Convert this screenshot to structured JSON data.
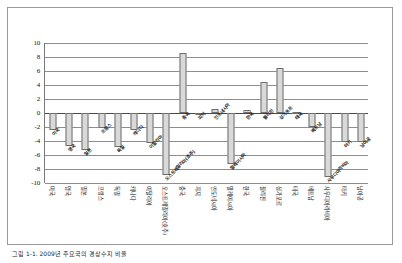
{
  "figure": {
    "caption": "그림 1-1. 2009년 주요국의 경상수지 비율"
  },
  "chart_data": {
    "type": "bar",
    "title": "",
    "subtitle": "",
    "xlabel": "",
    "ylabel": "",
    "ylim": [
      -10,
      10
    ],
    "ytick_values": [
      10,
      8,
      6,
      4,
      2,
      0,
      -2,
      -4,
      -6,
      -8,
      -10
    ],
    "ytick_labels": [
      "10",
      "8",
      "6",
      "4",
      "2",
      "0",
      "-2",
      "-4",
      "-6",
      "-8",
      "-10"
    ],
    "grid": true,
    "legend": "none",
    "bar_color": "#d9d9d9",
    "bar_edge_color": "#6e6e6e",
    "categories": [
      "미국",
      "영국",
      "일본",
      "프랑스",
      "독일",
      "캐나다",
      "이탈리아",
      "오스트레일리아(호주)",
      "중국",
      "피지",
      "인도네시아",
      "말레이시아",
      "한국",
      "필리핀",
      "싱가포르",
      "태국",
      "베트남",
      "사우디아라비아",
      "터키",
      "남아공"
    ],
    "values": [
      -2.4,
      -4.7,
      -5.3,
      -2.2,
      -4.9,
      -2.4,
      -4.3,
      -8.9,
      8.6,
      -0.2,
      0.6,
      -7.3,
      0.4,
      4.5,
      6.4,
      0.2,
      -2.0,
      -9.2,
      -4.1,
      -4.1
    ],
    "bar_annotations": [
      "미국",
      "영국",
      "일본",
      "프랑스",
      "독일",
      "캐나다",
      "이탈리아",
      "호주",
      "오스트레일리아",
      "중국",
      "피지",
      "인도네시아",
      "말레이시아",
      "한국",
      "필리핀",
      "싱가포르",
      "태국",
      "베트남",
      "사우디",
      "남아공"
    ],
    "positive_annotations": [
      {
        "index": 7,
        "text": "오스트레일리아"
      },
      {
        "index": 8,
        "text": "중국"
      },
      {
        "index": 9,
        "text": "피지"
      },
      {
        "index": 10,
        "text": "인도네시아"
      },
      {
        "index": 12,
        "text": "한국"
      },
      {
        "index": 13,
        "text": "필리핀"
      },
      {
        "index": 14,
        "text": "싱가포르"
      },
      {
        "index": 15,
        "text": "태국"
      }
    ]
  }
}
